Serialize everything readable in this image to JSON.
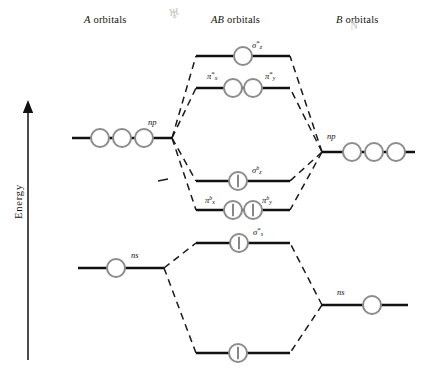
{
  "figure": {
    "type": "molecular-orbital-energy-diagram",
    "energy_axis_label": "Energy",
    "energy_axis_direction": "up",
    "columns": [
      {
        "id": "A",
        "label_italic": "A",
        "label_rest": " orbitals",
        "x": 110
      },
      {
        "id": "AB",
        "label_italic": "AB",
        "label_rest": " orbitals",
        "x": 243
      },
      {
        "id": "B",
        "label_italic": "B",
        "label_rest": " orbitals",
        "x": 370
      }
    ],
    "stray_marks": [
      {
        "name": "pencil-mark-left",
        "glyph": "♅",
        "x": 170,
        "y": 12,
        "size": 13,
        "rotate": -8
      },
      {
        "name": "pencil-mark-right",
        "glyph": "N",
        "x": 352,
        "y": 24,
        "size": 12,
        "rotate": -6
      }
    ],
    "levels": [
      {
        "id": "sigma-z-antibonding",
        "column": "AB",
        "y": 56,
        "x1": 196,
        "x2": 290,
        "label": "σ*z",
        "label_x": 252,
        "label_y": 44,
        "label_side": "right",
        "orbitals": [
          {
            "cx": 243,
            "electrons": 0
          }
        ]
      },
      {
        "id": "pi-antibonding",
        "column": "AB",
        "y": 88,
        "x1": 196,
        "x2": 290,
        "label": "π*x / π*y",
        "label_x": 0,
        "label_y": 0,
        "label_side": "both",
        "orbitals": [
          {
            "cx": 233,
            "electrons": 0
          },
          {
            "cx": 253,
            "electrons": 0
          }
        ]
      },
      {
        "id": "np-A",
        "column": "A",
        "y": 138,
        "x1": 72,
        "x2": 172,
        "label": "np",
        "label_x": 146,
        "label_y": 124,
        "label_side": "right",
        "orbitals": [
          {
            "cx": 100,
            "electrons": 0
          },
          {
            "cx": 122,
            "electrons": 0
          },
          {
            "cx": 144,
            "electrons": 0
          }
        ]
      },
      {
        "id": "np-B",
        "column": "B",
        "y": 152,
        "x1": 322,
        "x2": 415,
        "label": "np",
        "label_x": 330,
        "label_y": 138,
        "label_side": "right",
        "orbitals": [
          {
            "cx": 352,
            "electrons": 0
          },
          {
            "cx": 374,
            "electrons": 0
          },
          {
            "cx": 396,
            "electrons": 0
          }
        ]
      },
      {
        "id": "sigma-z-bonding",
        "column": "AB",
        "y": 181,
        "x1": 196,
        "x2": 290,
        "label": "σbz",
        "label_x": 252,
        "label_y": 169,
        "label_side": "right",
        "orbitals": [
          {
            "cx": 238,
            "electrons": 1
          }
        ]
      },
      {
        "id": "pi-bonding",
        "column": "AB",
        "y": 210,
        "x1": 196,
        "x2": 290,
        "label": "πbx / πby",
        "label_x": 0,
        "label_y": 0,
        "label_side": "both",
        "orbitals": [
          {
            "cx": 233,
            "electrons": 1
          },
          {
            "cx": 253,
            "electrons": 1
          }
        ]
      },
      {
        "id": "ns-A",
        "column": "A",
        "y": 268,
        "x1": 78,
        "x2": 164,
        "label": "ns",
        "label_x": 132,
        "label_y": 256,
        "label_side": "right",
        "orbitals": [
          {
            "cx": 116,
            "electrons": 0
          }
        ]
      },
      {
        "id": "sigma-s-antibonding",
        "column": "AB",
        "y": 243,
        "x1": 196,
        "x2": 290,
        "label": "σ*s",
        "label_x": 252,
        "label_y": 231,
        "label_side": "right",
        "orbitals": [
          {
            "cx": 239,
            "electrons": 1
          }
        ]
      },
      {
        "id": "ns-B",
        "column": "B",
        "y": 305,
        "x1": 322,
        "x2": 408,
        "label": "ns",
        "label_x": 338,
        "label_y": 293,
        "label_side": "right",
        "orbitals": [
          {
            "cx": 372,
            "electrons": 0
          }
        ]
      },
      {
        "id": "sigma-s-bonding",
        "column": "AB",
        "y": 353,
        "x1": 196,
        "x2": 290,
        "label": "",
        "label_x": 0,
        "label_y": 0,
        "label_side": "none",
        "orbitals": [
          {
            "cx": 238,
            "electrons": 1
          }
        ]
      }
    ],
    "orbital_labels": [
      {
        "name": "sigma-z-antibonding-label",
        "base": "σ",
        "sub": "z",
        "sup": "*",
        "x": 252,
        "y": 43
      },
      {
        "name": "pi-x-antibonding-label",
        "base": "π",
        "sub": "x",
        "sup": "*",
        "x": 208,
        "y": 74
      },
      {
        "name": "pi-y-antibonding-label",
        "base": "π",
        "sub": "y",
        "sup": "*",
        "x": 266,
        "y": 74
      },
      {
        "name": "np-A-label",
        "base": "np",
        "sub": "",
        "sup": "",
        "x": 150,
        "y": 122
      },
      {
        "name": "np-B-label",
        "base": "np",
        "sub": "",
        "sup": "",
        "x": 329,
        "y": 137
      },
      {
        "name": "sigma-z-bonding-label",
        "base": "σ",
        "sub": "z",
        "supb": "b",
        "x": 253,
        "y": 168
      },
      {
        "name": "pi-x-bonding-label",
        "base": "π",
        "sub": "x",
        "supb": "b",
        "x": 206,
        "y": 198
      },
      {
        "name": "pi-y-bonding-label",
        "base": "π",
        "sub": "y",
        "supb": "b",
        "x": 263,
        "y": 198
      },
      {
        "name": "sigma-s-antibonding-label",
        "base": "σ",
        "sub": "s",
        "sup": "*",
        "x": 253,
        "y": 230
      },
      {
        "name": "ns-A-label",
        "base": "ns",
        "sub": "",
        "sup": "",
        "x": 133,
        "y": 254
      },
      {
        "name": "ns-B-label",
        "base": "ns",
        "sub": "",
        "sup": "",
        "x": 339,
        "y": 291
      }
    ],
    "correlation_lines": [
      {
        "name": "A-np-to-sigma-z-star",
        "x1": 172,
        "y1": 138,
        "x2": 196,
        "y2": 56
      },
      {
        "name": "A-np-to-pi-star",
        "x1": 172,
        "y1": 138,
        "x2": 196,
        "y2": 88
      },
      {
        "name": "A-np-to-sigma-z-b",
        "x1": 172,
        "y1": 138,
        "x2": 196,
        "y2": 181
      },
      {
        "name": "A-np-to-pi-b",
        "x1": 172,
        "y1": 138,
        "x2": 196,
        "y2": 210
      },
      {
        "name": "B-np-to-sigma-z-star",
        "x1": 322,
        "y1": 152,
        "x2": 290,
        "y2": 56
      },
      {
        "name": "B-np-to-pi-star",
        "x1": 322,
        "y1": 152,
        "x2": 290,
        "y2": 88
      },
      {
        "name": "B-np-to-sigma-z-b",
        "x1": 322,
        "y1": 152,
        "x2": 290,
        "y2": 181
      },
      {
        "name": "B-np-to-pi-b",
        "x1": 322,
        "y1": 152,
        "x2": 290,
        "y2": 210
      },
      {
        "name": "A-ns-to-sigma-s-star",
        "x1": 164,
        "y1": 268,
        "x2": 196,
        "y2": 243
      },
      {
        "name": "A-ns-to-sigma-s-b",
        "x1": 164,
        "y1": 268,
        "x2": 196,
        "y2": 353
      },
      {
        "name": "B-ns-to-sigma-s-star",
        "x1": 322,
        "y1": 305,
        "x2": 290,
        "y2": 243
      },
      {
        "name": "B-ns-to-sigma-s-b",
        "x1": 322,
        "y1": 305,
        "x2": 290,
        "y2": 353
      }
    ],
    "tick_marks": [
      {
        "name": "stray-dash-left-upper",
        "x1": 160,
        "y1": 180,
        "x2": 168,
        "y2": 178
      }
    ],
    "style": {
      "level_line_color": "#111111",
      "level_line_width": 2.6,
      "orbital_circle_stroke": "#8c8c8c",
      "orbital_circle_fill": "#ffffff",
      "orbital_circle_radius": 9,
      "electron_color": "#555555",
      "dashed_line_color": "#1a1a1a",
      "dashed_pattern": "7 5",
      "axis_color": "#111111",
      "background": "#ffffff"
    }
  }
}
